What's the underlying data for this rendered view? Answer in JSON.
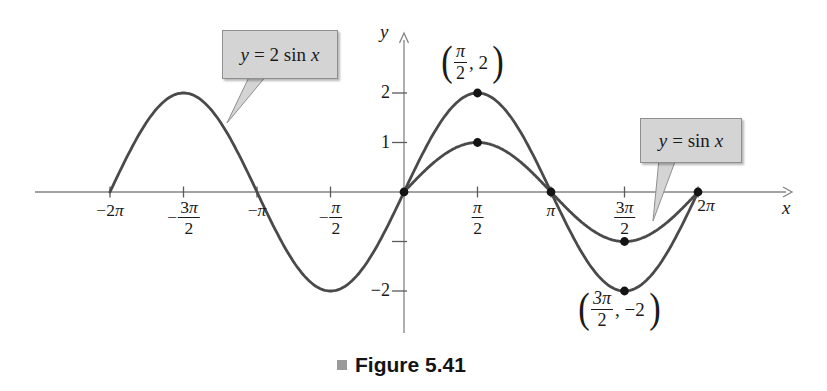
{
  "chart_data": {
    "type": "line",
    "title": "",
    "xlabel": "x",
    "ylabel": "y",
    "x_unit": "radians",
    "xlim_pi": [
      -2.5,
      2.6
    ],
    "ylim": [
      -2,
      2
    ],
    "grid": false,
    "series": [
      {
        "name": "y = 2 sin x",
        "function": "2*sin(x)",
        "amplitude": 2,
        "domain_pi": [
          -2,
          2
        ],
        "color": "#4a4a4a"
      },
      {
        "name": "y = sin x",
        "function": "sin(x)",
        "amplitude": 1,
        "domain_pi": [
          0,
          2
        ],
        "color": "#4a4a4a"
      }
    ],
    "x_ticks": [
      {
        "pi": -2,
        "text": "−2π"
      },
      {
        "pi": -1.5,
        "sign": "−",
        "num": "3π",
        "den": "2"
      },
      {
        "pi": -1,
        "text": "−π"
      },
      {
        "pi": -0.5,
        "sign": "−",
        "num": "π",
        "den": "2"
      },
      {
        "pi": 0.5,
        "num": "π",
        "den": "2"
      },
      {
        "pi": 1,
        "text": "π"
      },
      {
        "pi": 1.5,
        "num": "3π",
        "den": "2"
      },
      {
        "pi": 2,
        "text": "2π",
        "dx": 8,
        "dy": -5
      }
    ],
    "y_ticks": [
      {
        "value": 2,
        "text": "2"
      },
      {
        "value": 1,
        "text": "1"
      },
      {
        "value": -1,
        "text": ""
      },
      {
        "value": -2,
        "text": "−2"
      }
    ],
    "points": [
      {
        "x_pi": 0,
        "y": 0
      },
      {
        "x_pi": 0.5,
        "y": 2
      },
      {
        "x_pi": 0.5,
        "y": 1
      },
      {
        "x_pi": 1,
        "y": 0
      },
      {
        "x_pi": 1.5,
        "y": -1
      },
      {
        "x_pi": 1.5,
        "y": -2
      },
      {
        "x_pi": 2,
        "y": 0
      }
    ]
  },
  "callouts": {
    "two_sin": {
      "var_y": "y",
      "mid": "= 2 sin",
      "var_x": "x",
      "fill": "#d4d4d4",
      "border": "#8f8f8f"
    },
    "sin": {
      "var_y": "y",
      "mid": "= sin",
      "var_x": "x",
      "fill": "#d4d4d4",
      "border": "#8f8f8f"
    }
  },
  "annotations": {
    "peak": {
      "open": "(",
      "num": "π",
      "den": "2",
      "comma": ", ",
      "value": "2",
      "close": ")"
    },
    "trough": {
      "open": "(",
      "num": "3π",
      "den": "2",
      "comma": ", ",
      "value": "−2",
      "close": ")"
    }
  },
  "caption": {
    "text": "Figure 5.41",
    "bullet_color": "#9a9a9a"
  },
  "colors": {
    "curve": "#4a4a4a",
    "axis": "#858585",
    "tick": "#5a5a5a",
    "dot": "#141414",
    "text": "#1a1a1a"
  }
}
